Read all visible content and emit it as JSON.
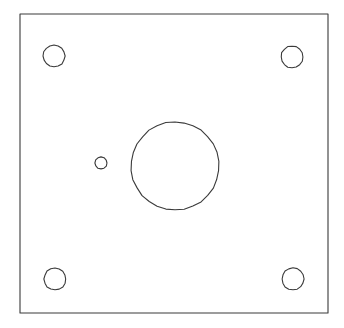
{
  "document": {
    "type": "engineering-drawing",
    "view": "plan-view",
    "title": "Rectangular Mounting Plate",
    "background_color": "#ffffff",
    "line_color": "#3a3a3a",
    "line_width": 1.1,
    "canvas": {
      "width": 344,
      "height": 328
    }
  },
  "drawing": {
    "plate": {
      "name": "plate-outline",
      "shape": "rectangle",
      "x": 20,
      "y": 14,
      "width": 308,
      "height": 299,
      "fill": "#ffffff",
      "stroke": "#3a3a3a"
    },
    "features": [
      {
        "name": "corner-hole-top-left",
        "shape": "circle",
        "cx": 54,
        "cy": 56,
        "r": 11,
        "sides": 16,
        "role": "mounting-hole"
      },
      {
        "name": "corner-hole-top-right",
        "shape": "circle",
        "cx": 292,
        "cy": 57,
        "r": 11,
        "sides": 16,
        "role": "mounting-hole"
      },
      {
        "name": "corner-hole-bottom-left",
        "shape": "circle",
        "cx": 55,
        "cy": 279,
        "r": 11,
        "sides": 16,
        "role": "mounting-hole"
      },
      {
        "name": "corner-hole-bottom-right",
        "shape": "circle",
        "cx": 293,
        "cy": 279,
        "r": 11,
        "sides": 16,
        "role": "mounting-hole"
      },
      {
        "name": "center-bore",
        "shape": "circle",
        "cx": 175,
        "cy": 166,
        "r": 44,
        "sides": 30,
        "role": "large-central-bore"
      },
      {
        "name": "small-offset-hole",
        "shape": "circle",
        "cx": 101,
        "cy": 163,
        "r": 6,
        "sides": 12,
        "role": "small-pilot-hole"
      }
    ]
  }
}
